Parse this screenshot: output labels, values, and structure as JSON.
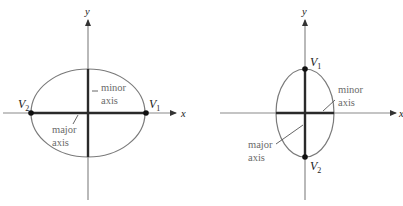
{
  "figures": [
    {
      "id": "horizontal-ellipse",
      "axes": {
        "x_label": "x",
        "y_label": "y"
      },
      "vertices": [
        {
          "label": "V",
          "sub": "1",
          "position": "right"
        },
        {
          "label": "V",
          "sub": "2",
          "position": "left"
        }
      ],
      "annotations": {
        "minor_line1": "minor",
        "minor_line2": "axis",
        "major_line1": "major",
        "major_line2": "axis"
      }
    },
    {
      "id": "vertical-ellipse",
      "axes": {
        "x_label": "x",
        "y_label": "y"
      },
      "vertices": [
        {
          "label": "V",
          "sub": "1",
          "position": "top"
        },
        {
          "label": "V",
          "sub": "2",
          "position": "bottom"
        }
      ],
      "annotations": {
        "minor_line1": "minor",
        "minor_line2": "axis",
        "major_line1": "major",
        "major_line2": "axis"
      }
    }
  ],
  "colors": {
    "axis": "#8a8a8a",
    "ellipse": "#7a7a7a",
    "major_minor": "#2a2a2a",
    "vertex": "#111111",
    "label_text": "#6a6a6a"
  }
}
